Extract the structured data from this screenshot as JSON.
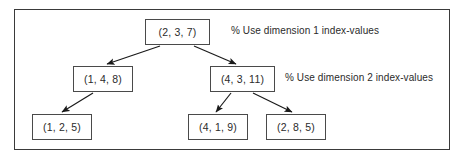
{
  "figure": {
    "background_color": "#ffffff",
    "frame_color": "#3a3a3a",
    "node_border_color": "#4a4a4a",
    "edge_color": "#1a1a1a",
    "text_color": "#2b2b2b"
  },
  "nodes": [
    {
      "id": "root",
      "label": "(2, 3, 7)",
      "x": 145,
      "y": 19,
      "w": 65,
      "h": 26
    },
    {
      "id": "left",
      "label": "(1, 4, 8)",
      "x": 73,
      "y": 66,
      "w": 60,
      "h": 26
    },
    {
      "id": "right",
      "label": "(4, 3, 11)",
      "x": 210,
      "y": 66,
      "w": 65,
      "h": 26
    },
    {
      "id": "left-child",
      "label": "(1, 2, 5)",
      "x": 32,
      "y": 114,
      "w": 60,
      "h": 26
    },
    {
      "id": "right-left",
      "label": "(4, 1, 9)",
      "x": 188,
      "y": 114,
      "w": 60,
      "h": 26
    },
    {
      "id": "right-right",
      "label": "(2, 8, 5)",
      "x": 266,
      "y": 114,
      "w": 60,
      "h": 26
    }
  ],
  "edges": [
    {
      "id": "root-to-left",
      "from": "root",
      "to": "left",
      "x1": 160,
      "y1": 46,
      "x2": 107,
      "y2": 64
    },
    {
      "id": "root-to-right",
      "from": "root",
      "to": "right",
      "x1": 194,
      "y1": 46,
      "x2": 236,
      "y2": 64
    },
    {
      "id": "left-to-left-child",
      "from": "left",
      "to": "left-child",
      "x1": 93,
      "y1": 93,
      "x2": 62,
      "y2": 112
    },
    {
      "id": "right-to-right-left",
      "from": "right",
      "to": "right-left",
      "x1": 231,
      "y1": 93,
      "x2": 216,
      "y2": 112
    },
    {
      "id": "right-to-right-right",
      "from": "right",
      "to": "right-right",
      "x1": 253,
      "y1": 93,
      "x2": 292,
      "y2": 112
    }
  ],
  "annotations": [
    {
      "id": "dim1-note",
      "text": "% Use dimension 1 index-values",
      "x": 231,
      "y": 26
    },
    {
      "id": "dim2-note",
      "text": "% Use dimension 2 index-values",
      "x": 285,
      "y": 73
    }
  ]
}
